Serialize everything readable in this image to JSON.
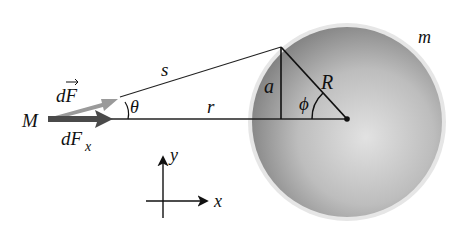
{
  "labels": {
    "mass_small": "M",
    "force": "dF",
    "force_x": "dF",
    "force_x_sub": "x",
    "theta": "θ",
    "s": "s",
    "r": "r",
    "a": "a",
    "R": "R",
    "phi": "ϕ",
    "mass_sphere": "m",
    "axis_x": "x",
    "axis_y": "y"
  },
  "colors": {
    "force_arrow": "#9a9a9a",
    "force_x_arrow": "#4a4a4a",
    "sphere_fill": "#b8b8b8",
    "line": "#222222"
  }
}
